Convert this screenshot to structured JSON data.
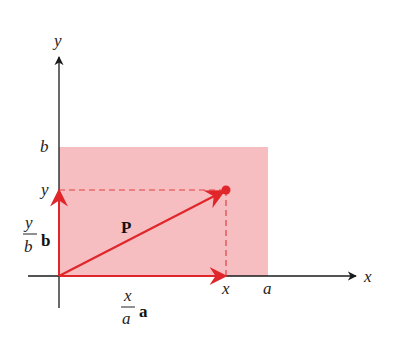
{
  "diagram": {
    "colors": {
      "region_fill": "#f5b3b5",
      "vector": "#e0262b",
      "axis": "#1a1a1a",
      "dash": "#e04045"
    },
    "labels": {
      "y_axis": "y",
      "x_axis": "x",
      "b_tick": "b",
      "y_tick": "y",
      "x_tick": "x",
      "a_tick": "a",
      "vector_P": "P",
      "frac_y_num": "y",
      "frac_y_den": "b",
      "frac_y_vec": "b",
      "frac_x_num": "x",
      "frac_x_den": "a",
      "frac_x_vec": "a"
    }
  }
}
